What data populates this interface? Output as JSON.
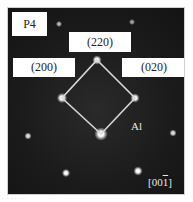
{
  "figure": {
    "panel_label": "P4",
    "phase_label": "Al",
    "zone_axis": {
      "prefix": "[00",
      "overlined_digit": "1",
      "suffix": "]"
    },
    "reflections": [
      {
        "name": "220",
        "label": "(220)"
      },
      {
        "name": "200",
        "label": "(200)"
      },
      {
        "name": "020",
        "label": "(020)"
      }
    ],
    "colors": {
      "background": "#1b1b1b",
      "spot": "#ffffff",
      "outline": "#d8d8d8",
      "label_box": "#ffffff",
      "label_text": "#222222"
    }
  }
}
